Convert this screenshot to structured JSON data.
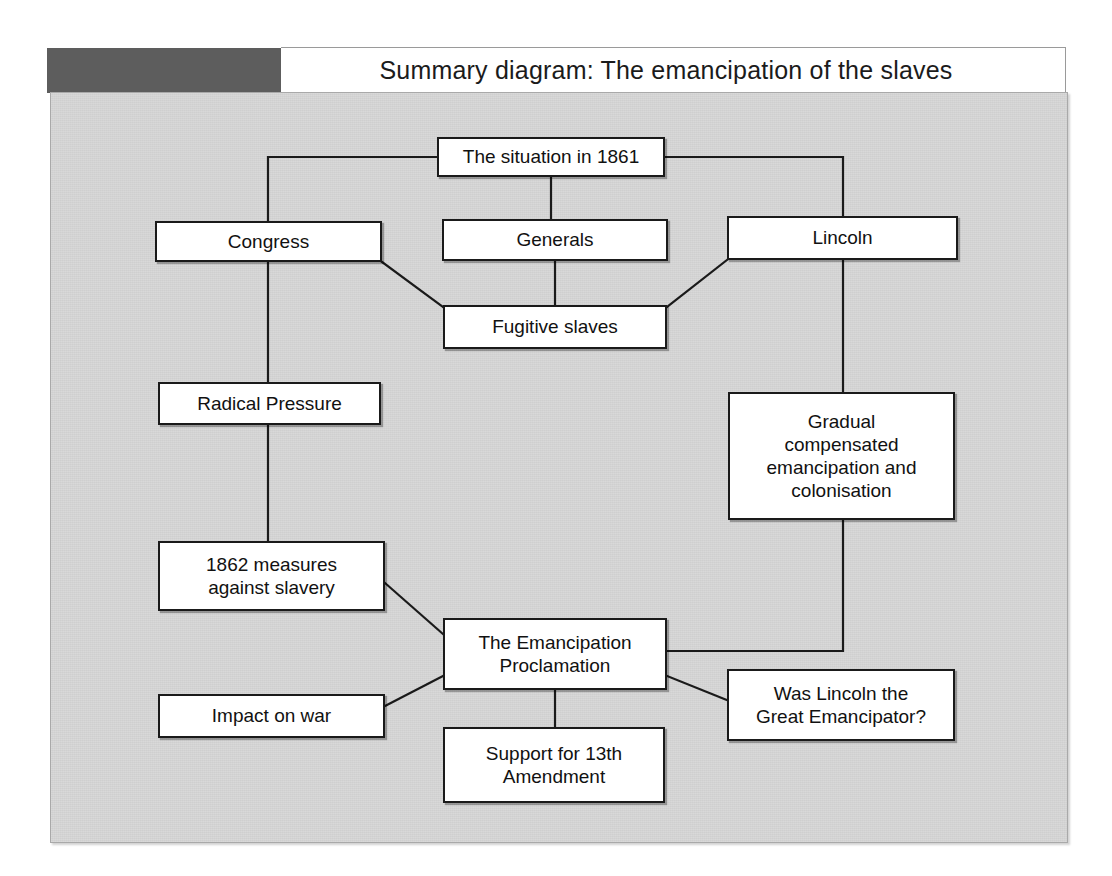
{
  "page": {
    "running_head": "",
    "background": "#ffffff"
  },
  "header": {
    "title": "Summary diagram:  The emancipation of the slaves",
    "dark_block_color": "#5d5d5d",
    "bar_color": "#ffffff"
  },
  "panel": {
    "background_color": "#cfcfcf",
    "border_color": "#a9a9a9"
  },
  "diagram": {
    "type": "flowchart",
    "title": "Summary diagram:  The emancipation of the slaves",
    "node_fill": "#ffffff",
    "node_border": "#1a1a1a",
    "connector_color": "#1a1a1a",
    "nodes": [
      {
        "id": "situation",
        "label": "The situation in 1861",
        "x": 437,
        "y": 137,
        "w": 228,
        "h": 40
      },
      {
        "id": "congress",
        "label": "Congress",
        "x": 155,
        "y": 221,
        "w": 227,
        "h": 41
      },
      {
        "id": "generals",
        "label": "Generals",
        "x": 442,
        "y": 219,
        "w": 226,
        "h": 42
      },
      {
        "id": "lincoln",
        "label": "Lincoln",
        "x": 727,
        "y": 216,
        "w": 231,
        "h": 44
      },
      {
        "id": "fugitive",
        "label": "Fugitive slaves",
        "x": 443,
        "y": 305,
        "w": 224,
        "h": 44
      },
      {
        "id": "radical",
        "label": "Radical Pressure",
        "x": 158,
        "y": 382,
        "w": 223,
        "h": 43
      },
      {
        "id": "gradual",
        "label": "Gradual\ncompensated\nemancipation and\ncolonisation",
        "x": 728,
        "y": 392,
        "w": 227,
        "h": 128
      },
      {
        "id": "measures",
        "label": "1862 measures\nagainst slavery",
        "x": 158,
        "y": 541,
        "w": 227,
        "h": 70
      },
      {
        "id": "proclam",
        "label": "The Emancipation\nProclamation",
        "x": 443,
        "y": 618,
        "w": 224,
        "h": 72
      },
      {
        "id": "impact",
        "label": "Impact on war",
        "x": 158,
        "y": 694,
        "w": 227,
        "h": 44
      },
      {
        "id": "question",
        "label": "Was Lincoln the\nGreat Emancipator?",
        "x": 727,
        "y": 669,
        "w": 228,
        "h": 72
      },
      {
        "id": "support",
        "label": "Support for 13th\nAmendment",
        "x": 443,
        "y": 727,
        "w": 222,
        "h": 76
      }
    ],
    "connections": [
      {
        "from": "situation",
        "to": "congress",
        "style": "orthogonal"
      },
      {
        "from": "situation",
        "to": "generals",
        "style": "vertical"
      },
      {
        "from": "situation",
        "to": "lincoln",
        "style": "orthogonal"
      },
      {
        "from": "congress",
        "to": "fugitive",
        "style": "diagonal"
      },
      {
        "from": "generals",
        "to": "fugitive",
        "style": "vertical"
      },
      {
        "from": "lincoln",
        "to": "fugitive",
        "style": "diagonal"
      },
      {
        "from": "congress",
        "to": "radical",
        "style": "vertical"
      },
      {
        "from": "radical",
        "to": "measures",
        "style": "vertical"
      },
      {
        "from": "lincoln",
        "to": "gradual",
        "style": "vertical"
      },
      {
        "from": "measures",
        "to": "proclam",
        "style": "diagonal"
      },
      {
        "from": "impact",
        "to": "proclam",
        "style": "diagonal"
      },
      {
        "from": "gradual",
        "to": "proclam",
        "style": "orthogonal"
      },
      {
        "from": "proclam",
        "to": "support",
        "style": "vertical"
      },
      {
        "from": "proclam",
        "to": "question",
        "style": "diagonal"
      }
    ]
  }
}
